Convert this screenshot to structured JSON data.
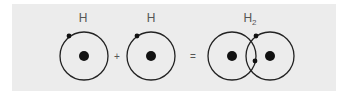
{
  "diagram": {
    "atoms": [
      {
        "label": "H"
      },
      {
        "label": "H"
      }
    ],
    "molecule": {
      "label": "H",
      "subscript": "2"
    },
    "operators": {
      "plus": "+",
      "equals": "="
    }
  }
}
